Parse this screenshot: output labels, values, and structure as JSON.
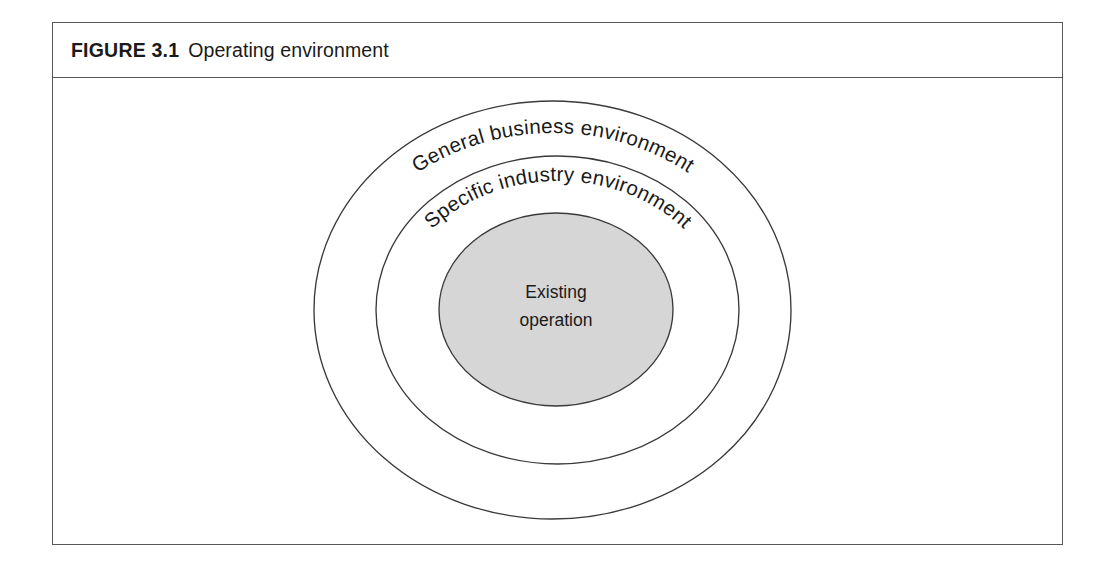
{
  "figure": {
    "label": "FIGURE 3.1",
    "title": "Operating environment"
  },
  "diagram": {
    "type": "concentric-ellipses",
    "rings": [
      {
        "id": "general-business-environment",
        "label": "General business environment",
        "level": 1,
        "fill": "#ffffff",
        "stroke": "#3a3a3a"
      },
      {
        "id": "specific-industry-environment",
        "label": "Specific industry environment",
        "level": 2,
        "fill": "#ffffff",
        "stroke": "#3a3a3a"
      },
      {
        "id": "existing-operation",
        "label_line1": "Existing",
        "label_line2": "operation",
        "level": 3,
        "fill": "#d6d6d6",
        "stroke": "#3a3a3a"
      }
    ]
  },
  "colors": {
    "frame_border": "#58585a",
    "outline": "#3a3a3a",
    "core_fill": "#d6d6d6",
    "text": "#1a1a1a",
    "background": "#ffffff"
  }
}
